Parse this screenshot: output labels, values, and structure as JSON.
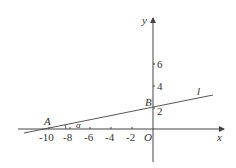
{
  "diagram": {
    "axes": {
      "x_label": "x",
      "y_label": "y",
      "origin_label": "O"
    },
    "x_ticks": [
      "-10",
      "-8",
      "-6",
      "-4",
      "-2"
    ],
    "y_ticks": [
      "2",
      "4",
      "6"
    ],
    "points": {
      "A": "A",
      "B": "B"
    },
    "line_label": "l",
    "angle_label": "α",
    "colors": {
      "stroke": "#444444",
      "text": "#333333"
    }
  }
}
